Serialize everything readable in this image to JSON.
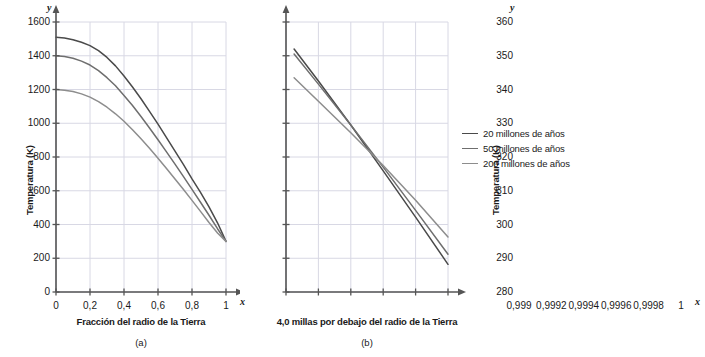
{
  "figure": {
    "panels": [
      {
        "letter": "(a)",
        "xlabel": "Fracción del radio de la Tierra",
        "ylabel": "Temperatura (K)",
        "x_axis_letter": "x",
        "y_axis_letter": "y"
      },
      {
        "letter": "(b)",
        "xlabel": "4,0 millas por debajo del radio de la Tierra",
        "ylabel": "Temperatura (K)",
        "x_axis_letter": "x",
        "y_axis_letter": "y"
      }
    ]
  },
  "legend": {
    "position": "right",
    "items": [
      {
        "label": "20 millones de años",
        "color": "#4a4a4a"
      },
      {
        "label": "50 millones de años",
        "color": "#6e6e6e"
      },
      {
        "label": "200 millones de años",
        "color": "#8d8d8d"
      }
    ]
  },
  "colors": {
    "axis": "#555555",
    "grid": "#d8d8e4",
    "text": "#1a1a1a",
    "background": "#ffffff"
  },
  "chart_data": [
    {
      "type": "line",
      "title": "(a)",
      "xlabel": "Fracción del radio de la Tierra",
      "ylabel": "Temperatura (K)",
      "xlim": [
        0,
        1
      ],
      "ylim": [
        0,
        1600
      ],
      "xticks": [
        0,
        0.2,
        0.4,
        0.6,
        0.8,
        1
      ],
      "xticklabels": [
        "0",
        "0,2",
        "0,4",
        "0,6",
        "0,8",
        "1"
      ],
      "yticks": [
        0,
        200,
        400,
        600,
        800,
        1000,
        1200,
        1400,
        1600
      ],
      "yticklabels": [
        "0",
        "200",
        "400",
        "600",
        "800",
        "1000",
        "1200",
        "1400",
        "1600"
      ],
      "grid": true,
      "legend_position": "right-outside",
      "x": [
        0,
        0.05,
        0.1,
        0.15,
        0.2,
        0.25,
        0.3,
        0.35,
        0.4,
        0.45,
        0.5,
        0.55,
        0.6,
        0.65,
        0.7,
        0.75,
        0.8,
        0.85,
        0.9,
        0.95,
        1
      ],
      "series": [
        {
          "name": "20 millones de años",
          "color": "#4a4a4a",
          "values": [
            1510,
            1505,
            1495,
            1480,
            1460,
            1430,
            1390,
            1340,
            1280,
            1215,
            1145,
            1070,
            995,
            915,
            835,
            755,
            670,
            590,
            505,
            410,
            300
          ]
        },
        {
          "name": "50 millones de años",
          "color": "#6e6e6e",
          "values": [
            1400,
            1395,
            1385,
            1368,
            1345,
            1312,
            1270,
            1222,
            1165,
            1105,
            1040,
            972,
            902,
            830,
            758,
            684,
            608,
            532,
            455,
            375,
            300
          ]
        },
        {
          "name": "200 millones de años",
          "color": "#8d8d8d",
          "values": [
            1200,
            1196,
            1188,
            1174,
            1155,
            1128,
            1095,
            1056,
            1012,
            962,
            908,
            852,
            793,
            732,
            670,
            607,
            543,
            478,
            412,
            350,
            300
          ]
        }
      ]
    },
    {
      "type": "line",
      "title": "(b)",
      "xlabel": "4,0 millas por debajo del radio de la Tierra",
      "ylabel": "Temperatura (K)",
      "xlim": [
        0.999,
        1
      ],
      "ylim": [
        280,
        360
      ],
      "xticks": [
        0.999,
        0.9992,
        0.9994,
        0.9996,
        0.9998,
        1
      ],
      "xticklabels": [
        "0,999",
        "0,9992",
        "0,9994",
        "0,9996",
        "0,9998",
        "1"
      ],
      "yticks": [
        280,
        290,
        300,
        310,
        320,
        330,
        340,
        350,
        360
      ],
      "yticklabels": [
        "280",
        "290",
        "300",
        "310",
        "320",
        "330",
        "340",
        "350",
        "360"
      ],
      "grid": true,
      "legend_position": "right-outside",
      "x": [
        0.99905,
        0.9992,
        0.9994,
        0.9996,
        0.9998,
        1
      ],
      "series": [
        {
          "name": "20 millones de años",
          "color": "#4a4a4a",
          "values": [
            352.0,
            342.5,
            329.5,
            315.9,
            302.2,
            288.2
          ]
        },
        {
          "name": "50 millones de años",
          "color": "#6e6e6e",
          "values": [
            350.5,
            341.6,
            329.5,
            317.0,
            304.2,
            291.2
          ]
        },
        {
          "name": "200 millones de años",
          "color": "#8d8d8d",
          "values": [
            343.5,
            336.5,
            327.2,
            317.5,
            307.2,
            296.3
          ]
        }
      ]
    }
  ]
}
